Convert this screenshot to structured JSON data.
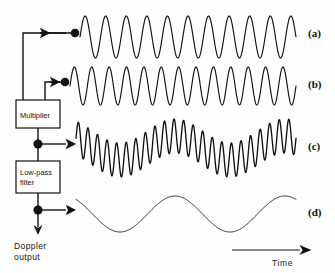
{
  "figure": {
    "background": "#fefefe",
    "ink": "#111111",
    "width": 335,
    "height": 273
  },
  "blocks": [
    {
      "id": "multiplier",
      "label": "Multiplier",
      "x": 16,
      "y": 100,
      "w": 44,
      "h": 28
    },
    {
      "id": "lowpass",
      "label_line1": "Low-pass",
      "label_line2": "filter",
      "x": 16,
      "y": 161,
      "w": 44,
      "h": 32
    }
  ],
  "output": {
    "label_line1": "Doppler",
    "label_line2": "output"
  },
  "axis": {
    "time_label": "Time"
  },
  "traces": [
    {
      "id": "a",
      "label": "(a)",
      "description": "transmitted reference carrier, constant amplitude",
      "cycles": 10.5,
      "amplitude": 21,
      "baseline": 37,
      "x_start": 80,
      "x_end": 296,
      "stroke": "wave-thin",
      "envelope": "none"
    },
    {
      "id": "b",
      "label": "(b)",
      "description": "received Doppler-shifted echo, higher frequency, constant amplitude",
      "cycles": 13.0,
      "amplitude": 19,
      "baseline": 86,
      "x_start": 70,
      "x_end": 296,
      "stroke": "wave-thin",
      "envelope": "none"
    },
    {
      "id": "c",
      "label": "(c)",
      "description": "multiplier output: high-frequency carrier amplitude-modulated by low-frequency Doppler envelope",
      "cycles": 23.0,
      "amplitude": 17,
      "baseline": 148,
      "x_start": 76,
      "x_end": 296,
      "stroke": "wave-mid",
      "envelope": "sine",
      "envelope_cycles": 2.0,
      "envelope_amplitude": 12,
      "envelope_phase": 0.35
    },
    {
      "id": "d",
      "label": "(d)",
      "description": "low-pass filtered Doppler output, smooth low-frequency sine",
      "cycles": 2.0,
      "amplitude": 18,
      "baseline": 214,
      "x_start": 76,
      "x_end": 296,
      "stroke": "wave-fine",
      "envelope": "none",
      "phase": 0.35
    }
  ],
  "taps": [
    {
      "id": "tap-a",
      "dot_x": 75,
      "dot_y": 33,
      "direction": "left",
      "connects_to": "trace-a"
    },
    {
      "id": "tap-b",
      "dot_x": 65,
      "dot_y": 82,
      "direction": "left",
      "connects_to": "trace-b"
    },
    {
      "id": "tap-c",
      "dot_x": 38,
      "dot_y": 144,
      "direction": "right",
      "connects_to": "trace-c"
    },
    {
      "id": "tap-d",
      "dot_x": 38,
      "dot_y": 210,
      "direction": "right",
      "connects_to": "trace-d"
    }
  ]
}
